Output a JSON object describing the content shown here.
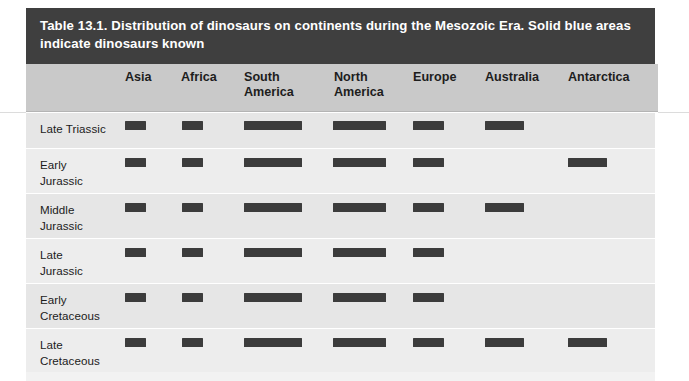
{
  "caption": {
    "label": "Table 13.1.",
    "text": "Distribution of dinosaurs on continents during the Mesozoic Era. Solid blue areas indicate dinosaurs known",
    "full": "Table 13.1.  Distribution of dinosaurs on continents during the Mesozoic Era. Solid blue areas indicate dinosaurs known"
  },
  "colors": {
    "caption_bar": "#3f3f3f",
    "caption_text": "#ffffff",
    "header_band": "#c9c9c9",
    "row_shade_a": "#e6e6e6",
    "row_shade_b": "#ededed",
    "bar_fill": "#3c3c3c",
    "page_background": "#ffffff"
  },
  "table": {
    "row_header_label": "",
    "columns": [
      {
        "label": "Asia",
        "x": 125,
        "bar_x": 125,
        "bar_w": 21
      },
      {
        "label": "Africa",
        "x": 181,
        "bar_x": 182,
        "bar_w": 21
      },
      {
        "label": "South\nAmerica",
        "x": 244,
        "bar_x": 244,
        "bar_w": 58
      },
      {
        "label": "North\nAmerica",
        "x": 334,
        "bar_x": 333,
        "bar_w": 53
      },
      {
        "label": "Europe",
        "x": 413,
        "bar_x": 413,
        "bar_w": 31
      },
      {
        "label": "Australia",
        "x": 485,
        "bar_x": 485,
        "bar_w": 39
      },
      {
        "label": "Antarctica",
        "x": 568,
        "bar_x": 568,
        "bar_w": 39
      }
    ],
    "rows": [
      {
        "label": "Late Triassic",
        "cells": [
          true,
          true,
          true,
          true,
          true,
          true,
          false
        ]
      },
      {
        "label": "Early\nJurassic",
        "cells": [
          true,
          true,
          true,
          true,
          true,
          false,
          true
        ]
      },
      {
        "label": "Middle\nJurassic",
        "cells": [
          true,
          true,
          true,
          true,
          true,
          true,
          false
        ]
      },
      {
        "label": "Late\nJurassic",
        "cells": [
          true,
          true,
          true,
          true,
          true,
          false,
          false
        ]
      },
      {
        "label": "Early\nCretaceous",
        "cells": [
          true,
          true,
          true,
          true,
          true,
          false,
          false
        ]
      },
      {
        "label": "Late\nCretaceous",
        "cells": [
          true,
          true,
          true,
          true,
          true,
          true,
          true
        ]
      }
    ]
  }
}
